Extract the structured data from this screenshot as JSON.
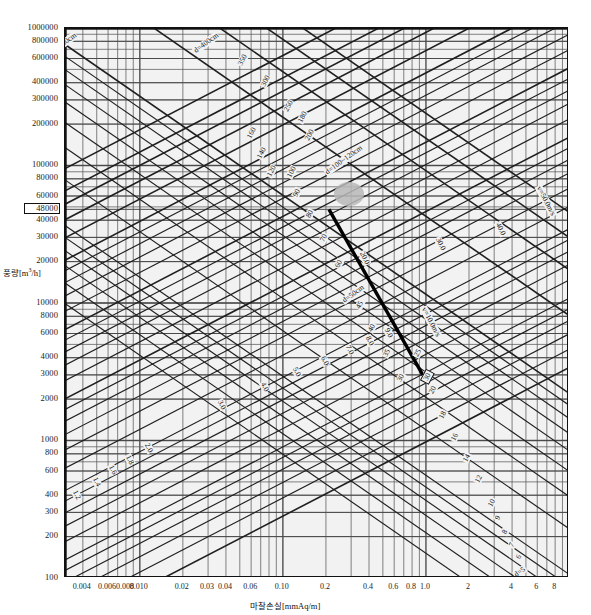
{
  "title": "",
  "chart_data": {
    "type": "line",
    "title": "",
    "xlabel": "마찰손실[mmAq/m]",
    "ylabel": "풍량[m³/h]",
    "xscale": "log",
    "yscale": "log",
    "xlim": [
      0.003,
      10
    ],
    "ylim": [
      100,
      1000000
    ],
    "grid": true,
    "legend_position": "none",
    "xticks": [
      "0.004",
      "0.006",
      "0.008",
      "0.010",
      "0.02",
      "0.03",
      "0.04",
      "0.06",
      "0.10",
      "0.2",
      "0.4",
      "0.6",
      "0.8",
      "1.0",
      "2",
      "4",
      "6",
      "8"
    ],
    "xtick_values": [
      0.004,
      0.006,
      0.008,
      0.01,
      0.02,
      0.03,
      0.04,
      0.06,
      0.1,
      0.2,
      0.4,
      0.6,
      0.8,
      1.0,
      2,
      4,
      6,
      8
    ],
    "yticks": [
      "1000000",
      "800000",
      "600000",
      "400000",
      "300000",
      "200000",
      "100000",
      "80000",
      "60000",
      "48000",
      "40000",
      "30000",
      "20000",
      "10000",
      "8000",
      "6000",
      "4000",
      "3000",
      "2000",
      "1000",
      "800",
      "600",
      "400",
      "300",
      "200",
      "100"
    ],
    "ytick_values": [
      1000000,
      800000,
      600000,
      400000,
      300000,
      200000,
      100000,
      80000,
      60000,
      48000,
      40000,
      30000,
      20000,
      10000,
      8000,
      6000,
      4000,
      3000,
      2000,
      1000,
      800,
      600,
      400,
      300,
      200,
      100
    ],
    "highlighted_ytick": "48000",
    "series": [
      {
        "name": "duct diameter d [cm]",
        "kind": "diagonal-family-up",
        "values": [
          500,
          400,
          350,
          300,
          250,
          200,
          180,
          160,
          140,
          120,
          100,
          90,
          80,
          70,
          60,
          50,
          45,
          40,
          35,
          30,
          25,
          20,
          18,
          16,
          14,
          12,
          10,
          9,
          8,
          7,
          6,
          5
        ]
      },
      {
        "name": "air velocity v [m/s]",
        "kind": "diagonal-family-down",
        "values": [
          1.0,
          1.2,
          1.4,
          1.6,
          1.8,
          2.0,
          3.0,
          4.0,
          5.0,
          6.0,
          7.0,
          8.0,
          9.0,
          10.0,
          20.0,
          30.0,
          40.0,
          50.0
        ]
      }
    ],
    "annotations": [
      {
        "text": "d=500cm",
        "kind": "diameter-label"
      },
      {
        "text": "d=400cm",
        "kind": "diameter-label"
      },
      {
        "text": "d=100~120cm",
        "kind": "diameter-label"
      },
      {
        "text": "d=50cm",
        "kind": "diameter-label"
      },
      {
        "text": "d=5",
        "kind": "diameter-label"
      },
      {
        "text": "v=1.0m/s",
        "kind": "velocity-label"
      },
      {
        "text": "v=10.0m/s",
        "kind": "velocity-label"
      },
      {
        "text": "v=50.0m/s",
        "kind": "velocity-label"
      },
      {
        "text": "30",
        "kind": "boxed-answer-diameter"
      },
      {
        "text": "100",
        "kind": "highlighted-diameter"
      }
    ],
    "solution_line": {
      "description": "thick construction line from the 48000 m³/h / d=100cm point down-right to the boxed d=30 point",
      "from": {
        "x": 0.21,
        "y": 48000
      },
      "to": {
        "x": 0.95,
        "y": 3000
      }
    }
  },
  "axis": {
    "y_label": "풍량[m³/h]",
    "x_label": "마찰손실[mmAq/m]",
    "y_ticks": [
      {
        "text": "1000000",
        "v": 1000000,
        "boxed": false
      },
      {
        "text": "800000",
        "v": 800000,
        "boxed": false
      },
      {
        "text": "600000",
        "v": 600000,
        "boxed": false
      },
      {
        "text": "400000",
        "v": 400000,
        "boxed": false
      },
      {
        "text": "300000",
        "v": 300000,
        "boxed": false
      },
      {
        "text": "200000",
        "v": 200000,
        "boxed": false
      },
      {
        "text": "100000",
        "v": 100000,
        "boxed": false
      },
      {
        "text": "80000",
        "v": 80000,
        "boxed": false
      },
      {
        "text": "60000",
        "v": 60000,
        "boxed": false
      },
      {
        "text": "48000",
        "v": 48000,
        "boxed": true
      },
      {
        "text": "40000",
        "v": 40000,
        "boxed": false
      },
      {
        "text": "30000",
        "v": 30000,
        "boxed": false
      },
      {
        "text": "20000",
        "v": 20000,
        "boxed": false
      },
      {
        "text": "10000",
        "v": 10000,
        "boxed": false
      },
      {
        "text": "8000",
        "v": 8000,
        "boxed": false
      },
      {
        "text": "6000",
        "v": 6000,
        "boxed": false
      },
      {
        "text": "4000",
        "v": 4000,
        "boxed": false
      },
      {
        "text": "3000",
        "v": 3000,
        "boxed": false
      },
      {
        "text": "2000",
        "v": 2000,
        "boxed": false
      },
      {
        "text": "1000",
        "v": 1000,
        "boxed": false
      },
      {
        "text": "800",
        "v": 800,
        "boxed": false
      },
      {
        "text": "600",
        "v": 600,
        "boxed": false
      },
      {
        "text": "400",
        "v": 400,
        "boxed": false
      },
      {
        "text": "300",
        "v": 300,
        "boxed": false
      },
      {
        "text": "200",
        "v": 200,
        "boxed": false
      },
      {
        "text": "100",
        "v": 100,
        "boxed": false
      }
    ],
    "x_ticks": [
      {
        "text": "0.004",
        "v": 0.004
      },
      {
        "text": "0.006",
        "v": 0.006
      },
      {
        "text": "0.008",
        "v": 0.008
      },
      {
        "text": "0.010",
        "v": 0.01
      },
      {
        "text": "0.02",
        "v": 0.02
      },
      {
        "text": "0.03",
        "v": 0.03
      },
      {
        "text": "0.04",
        "v": 0.04
      },
      {
        "text": "0.06",
        "v": 0.06
      },
      {
        "text": "0.10",
        "v": 0.1
      },
      {
        "text": "0.2",
        "v": 0.2
      },
      {
        "text": "0.4",
        "v": 0.4
      },
      {
        "text": "0.6",
        "v": 0.6
      },
      {
        "text": "0.8",
        "v": 0.8
      },
      {
        "text": "1.0",
        "v": 1.0
      },
      {
        "text": "2",
        "v": 2
      },
      {
        "text": "4",
        "v": 4
      },
      {
        "text": "6",
        "v": 6
      },
      {
        "text": "8",
        "v": 8
      }
    ]
  },
  "curve_labels": [
    {
      "t": "d=500cm",
      "x": 48,
      "y": 38,
      "r": -36,
      "s": 7.5
    },
    {
      "t": "d=400cm",
      "x": 190,
      "y": 38,
      "r": -36,
      "s": 7.5
    },
    {
      "t": "350",
      "x": 235,
      "y": 55,
      "r": -62,
      "s": 7.5
    },
    {
      "t": "300",
      "x": 258,
      "y": 76,
      "r": -62,
      "s": 7.5
    },
    {
      "t": "250",
      "x": 281,
      "y": 101,
      "r": -62,
      "s": 7.5
    },
    {
      "t": "200",
      "x": 302,
      "y": 130,
      "r": -62,
      "s": 7.5
    },
    {
      "t": "180",
      "x": 295,
      "y": 112,
      "r": -62,
      "s": 7.5
    },
    {
      "t": "160",
      "x": 244,
      "y": 128,
      "r": -62,
      "s": 7.5
    },
    {
      "t": "140",
      "x": 254,
      "y": 148,
      "r": -62,
      "s": 7.5
    },
    {
      "t": "120",
      "x": 264,
      "y": 166,
      "r": -62,
      "s": 7.5
    },
    {
      "t": "100",
      "x": 284,
      "y": 167,
      "r": -62,
      "s": 7.5
    },
    {
      "t": "d=100~120cm",
      "x": 320,
      "y": 155,
      "r": -36,
      "s": 7.5
    },
    {
      "t": "90",
      "x": 291,
      "y": 188,
      "r": -62,
      "s": 7.5
    },
    {
      "t": "80",
      "x": 304,
      "y": 209,
      "r": -62,
      "s": 7.5
    },
    {
      "t": "70",
      "x": 318,
      "y": 233,
      "r": -62,
      "s": 7.5
    },
    {
      "t": "60",
      "x": 333,
      "y": 259,
      "r": -62,
      "s": 7.5
    },
    {
      "t": "d=50cm",
      "x": 339,
      "y": 289,
      "r": -36,
      "s": 7.5
    },
    {
      "t": "45",
      "x": 354,
      "y": 300,
      "r": -62,
      "s": 7.5
    },
    {
      "t": "40",
      "x": 366,
      "y": 323,
      "r": -62,
      "s": 7.5
    },
    {
      "t": "35",
      "x": 381,
      "y": 348,
      "r": -62,
      "s": 7.5
    },
    {
      "t": "30",
      "x": 395,
      "y": 373,
      "r": -62,
      "s": 7.5
    },
    {
      "t": "25",
      "x": 412,
      "y": 348,
      "r": -62,
      "s": 7.5
    },
    {
      "t": "20",
      "x": 427,
      "y": 385,
      "r": -62,
      "s": 7.5
    },
    {
      "t": "18",
      "x": 437,
      "y": 410,
      "r": -62,
      "s": 7.5
    },
    {
      "t": "16",
      "x": 449,
      "y": 432,
      "r": -62,
      "s": 7.5
    },
    {
      "t": "14",
      "x": 461,
      "y": 453,
      "r": -62,
      "s": 7.5
    },
    {
      "t": "12",
      "x": 473,
      "y": 474,
      "r": -62,
      "s": 7.5
    },
    {
      "t": "10",
      "x": 486,
      "y": 498,
      "r": -62,
      "s": 7.5
    },
    {
      "t": "9",
      "x": 494,
      "y": 513,
      "r": -62,
      "s": 7.5
    },
    {
      "t": "8",
      "x": 501,
      "y": 527,
      "r": -62,
      "s": 7.5
    },
    {
      "t": "7",
      "x": 508,
      "y": 540,
      "r": -62,
      "s": 7.5
    },
    {
      "t": "6",
      "x": 515,
      "y": 552,
      "r": -62,
      "s": 7.5
    },
    {
      "t": "d=5",
      "x": 512,
      "y": 567,
      "r": -36,
      "s": 7.5
    },
    {
      "t": "1.0",
      "x": 52,
      "y": 497,
      "r": 62,
      "s": 7.5
    },
    {
      "t": "1.2",
      "x": 70,
      "y": 490,
      "r": 62,
      "s": 7.5
    },
    {
      "t": "1.4",
      "x": 90,
      "y": 477,
      "r": 62,
      "s": 7.5
    },
    {
      "t": "1.6",
      "x": 106,
      "y": 465,
      "r": 62,
      "s": 7.5
    },
    {
      "t": "1.8",
      "x": 123,
      "y": 455,
      "r": 62,
      "s": 7.5
    },
    {
      "t": "2.0",
      "x": 142,
      "y": 443,
      "r": 62,
      "s": 7.5
    },
    {
      "t": "3.0",
      "x": 215,
      "y": 400,
      "r": 62,
      "s": 7.5
    },
    {
      "t": "4.0",
      "x": 258,
      "y": 382,
      "r": 62,
      "s": 7.5
    },
    {
      "t": "5.0",
      "x": 290,
      "y": 367,
      "r": 62,
      "s": 7.5
    },
    {
      "t": "6.0",
      "x": 318,
      "y": 356,
      "r": 62,
      "s": 7.5
    },
    {
      "t": "7.0",
      "x": 343,
      "y": 345,
      "r": 62,
      "s": 7.5
    },
    {
      "t": "8.0",
      "x": 363,
      "y": 336,
      "r": 62,
      "s": 7.5
    },
    {
      "t": "9.0",
      "x": 382,
      "y": 328,
      "r": 62,
      "s": 7.5
    },
    {
      "t": "v=10.0m/s",
      "x": 413,
      "y": 317,
      "r": 62,
      "s": 7.5
    },
    {
      "t": "20.0",
      "x": 356,
      "y": 253,
      "r": 62,
      "s": 7.5
    },
    {
      "t": "30.0",
      "x": 432,
      "y": 239,
      "r": 62,
      "s": 7.5
    },
    {
      "t": "40.0",
      "x": 492,
      "y": 224,
      "r": 62,
      "s": 7.5
    },
    {
      "t": "v=50.0m/s",
      "x": 528,
      "y": 196,
      "r": 62,
      "s": 7.5
    }
  ],
  "boxed_answer": {
    "text": "30",
    "x": 420,
    "y": 371,
    "r": -62
  },
  "highlight": {
    "cx": 348,
    "cy": 193,
    "rx": 15,
    "ry": 12,
    "color": "#b9b9b9"
  }
}
